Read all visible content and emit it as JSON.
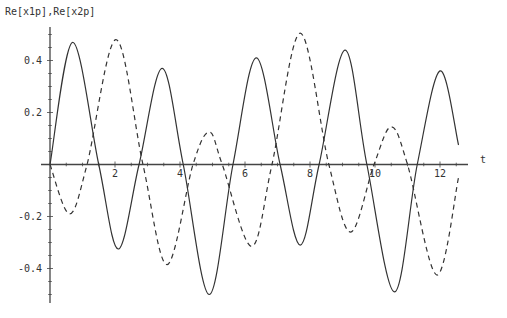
{
  "chart_data": {
    "type": "line",
    "title": "",
    "xlabel": "t",
    "ylabel": "Re[x1p],Re[x2p]",
    "xlim": [
      0,
      12.57
    ],
    "ylim": [
      -0.52,
      0.52
    ],
    "grid": false,
    "legend": null,
    "x_ticks": [
      2,
      4,
      6,
      8,
      10,
      12
    ],
    "x_tick_labels": [
      "2",
      "4",
      "6",
      "8",
      "10",
      "12"
    ],
    "y_ticks": [
      -0.4,
      -0.2,
      0.2,
      0.4
    ],
    "y_tick_labels": [
      "-0.4",
      "-0.2",
      "0.2",
      "0.4"
    ],
    "series": [
      {
        "name": "Re[x1p]",
        "style": "solid",
        "color": "#333333",
        "x": [
          0,
          0.7,
          1.5,
          2.1,
          2.74,
          3.45,
          4.1,
          4.9,
          5.63,
          6.35,
          7.08,
          7.7,
          8.28,
          9.08,
          9.75,
          10.6,
          11.3,
          12.0,
          12.57
        ],
        "y": [
          0,
          0.47,
          0,
          -0.325,
          0,
          0.37,
          0,
          -0.5,
          0,
          0.41,
          0,
          -0.31,
          0,
          0.44,
          0,
          -0.49,
          0,
          0.36,
          0.075
        ]
      },
      {
        "name": "Re[x2p]",
        "style": "dashed",
        "color": "#333333",
        "x": [
          0,
          0.6,
          1.14,
          2.03,
          2.86,
          3.6,
          4.4,
          4.9,
          5.3,
          6.2,
          6.83,
          7.7,
          8.58,
          9.25,
          9.97,
          10.5,
          11.0,
          11.9,
          12.57
        ],
        "y": [
          0,
          -0.19,
          0,
          0.48,
          0,
          -0.385,
          0,
          0.125,
          0,
          -0.315,
          0,
          0.505,
          0,
          -0.26,
          0,
          0.145,
          0,
          -0.425,
          -0.05
        ]
      }
    ]
  },
  "axes": {
    "y_title": "Re[x1p],Re[x2p]",
    "x_title": "t"
  }
}
